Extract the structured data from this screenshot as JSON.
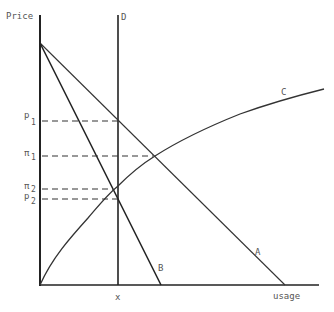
{
  "diagram": {
    "axis_y_label": "Price",
    "axis_x_label": "usage",
    "vertical_line_label": "D",
    "x_tick_label": "x",
    "curves": {
      "A": "A",
      "B": "B",
      "C": "C"
    },
    "price_levels": [
      {
        "name": "p1",
        "base": "p",
        "sub": "1"
      },
      {
        "name": "pi1",
        "base": "π",
        "sub": "1"
      },
      {
        "name": "pi2",
        "base": "π",
        "sub": "2"
      },
      {
        "name": "p2",
        "base": "p",
        "sub": "2"
      }
    ],
    "colors": {
      "line": "#333333",
      "text": "#555555",
      "background": "#ffffff"
    }
  }
}
